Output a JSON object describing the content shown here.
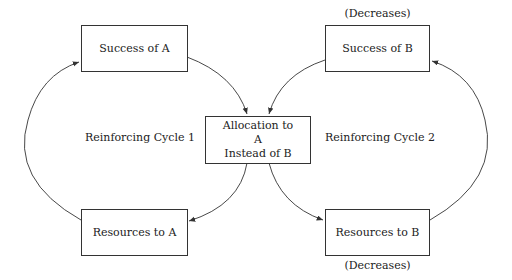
{
  "diagram": {
    "nodes": {
      "success_a": "Success of A",
      "success_b": "Success of B",
      "allocation_line1": "Allocation to",
      "allocation_line2": "A",
      "allocation_line3": "Instead of B",
      "resources_a": "Resources to A",
      "resources_b": "Resources to B"
    },
    "annotations": {
      "success_b_note": "(Decreases)",
      "resources_b_note": "(Decreases)"
    },
    "cycles": {
      "cycle1": "Reinforcing Cycle 1",
      "cycle2": "Reinforcing Cycle 2"
    },
    "colors": {
      "line": "#333333",
      "background": "#ffffff"
    }
  }
}
